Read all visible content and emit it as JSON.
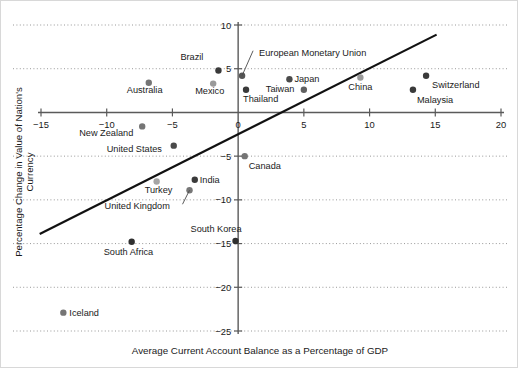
{
  "chart_data": {
    "type": "scatter",
    "title": "",
    "xlabel": "Average Current Account Balance as a Percentage of GDP",
    "ylabel": "Percentage Change in Value of Nation's Currency",
    "xlim": [
      -15,
      20
    ],
    "ylim": [
      -25,
      10
    ],
    "xticks": [
      "-15",
      "-10",
      "-5",
      "0",
      "5",
      "10",
      "15",
      "20"
    ],
    "xtick_values": [
      -15,
      -10,
      -5,
      0,
      5,
      10,
      15,
      20
    ],
    "yticks": [
      "10",
      "5",
      "-5",
      "-10",
      "-15",
      "-20",
      "-25"
    ],
    "ytick_values": [
      10,
      5,
      -5,
      -10,
      -15,
      -20,
      -25
    ],
    "grid": "horizontal-dotted",
    "legend": "none",
    "points": [
      {
        "name": "Brazil",
        "x": -1.5,
        "y": 4.8,
        "color": "#3a3a3a",
        "label_dx": -38,
        "label_dy": -12
      },
      {
        "name": "European Monetary Union",
        "x": 0.3,
        "y": 4.2,
        "color": "#555555",
        "label_dx": 17,
        "label_dy": -22,
        "leader": true
      },
      {
        "name": "Australia",
        "x": -6.8,
        "y": 3.4,
        "color": "#757575",
        "label_dx": -22,
        "label_dy": 8
      },
      {
        "name": "Mexico",
        "x": -1.9,
        "y": 3.3,
        "color": "#9a9a9a",
        "label_dx": -18,
        "label_dy": 8
      },
      {
        "name": "Japan",
        "x": 3.9,
        "y": 3.8,
        "color": "#4a4a4a",
        "label_dx": 5,
        "label_dy": 1
      },
      {
        "name": "Taiwan",
        "x": 5.0,
        "y": 2.6,
        "color": "#606060",
        "label_dx": -38,
        "label_dy": 0
      },
      {
        "name": "Thailand",
        "x": 0.6,
        "y": 2.6,
        "color": "#3a3a3a",
        "label_dx": -3,
        "label_dy": 10
      },
      {
        "name": "China",
        "x": 9.3,
        "y": 4.0,
        "color": "#9a9a9a",
        "label_dx": -12,
        "label_dy": 11
      },
      {
        "name": "Switzerland",
        "x": 14.3,
        "y": 4.2,
        "color": "#3a3a3a",
        "label_dx": 6,
        "label_dy": 10
      },
      {
        "name": "Malaysia",
        "x": 13.3,
        "y": 2.6,
        "color": "#3a3a3a",
        "label_dx": 4,
        "label_dy": 11
      },
      {
        "name": "New Zealand",
        "x": -7.3,
        "y": -1.6,
        "color": "#757575",
        "label_dx": -63,
        "label_dy": 8
      },
      {
        "name": "United States",
        "x": -4.9,
        "y": -3.8,
        "color": "#4a4a4a",
        "label_dx": -67,
        "label_dy": 4
      },
      {
        "name": "Canada",
        "x": 0.5,
        "y": -5.0,
        "color": "#757575",
        "label_dx": 4,
        "label_dy": 11
      },
      {
        "name": "Turkey",
        "x": -6.2,
        "y": -7.9,
        "color": "#a5a5a5",
        "label_dx": -12,
        "label_dy": 10
      },
      {
        "name": "India",
        "x": -3.3,
        "y": -7.7,
        "color": "#3a3a3a",
        "label_dx": 5,
        "label_dy": 1
      },
      {
        "name": "United Kingdom",
        "x": -3.7,
        "y": -8.9,
        "color": "#777777",
        "label_dx": -85,
        "label_dy": 17,
        "leader": true
      },
      {
        "name": "South Korea",
        "x": -0.2,
        "y": -14.7,
        "color": "#2f2f2f",
        "label_dx": -45,
        "label_dy": -11
      },
      {
        "name": "South Africa",
        "x": -8.1,
        "y": -14.8,
        "color": "#2f2f2f",
        "label_dx": -28,
        "label_dy": 11
      },
      {
        "name": "Iceland",
        "x": -13.3,
        "y": -22.9,
        "color": "#757575",
        "label_dx": 6,
        "label_dy": 1
      }
    ],
    "trendline": {
      "x0": -15.1,
      "y0": -13.9,
      "x1": 15.1,
      "y1": 8.9
    }
  },
  "colors": {
    "axis": "#5a5a5a",
    "grid": "#8d8d8d",
    "trend": "#111111",
    "text": "#1a1a1a",
    "frame": "#d8d8d8",
    "background": "#ffffff"
  }
}
